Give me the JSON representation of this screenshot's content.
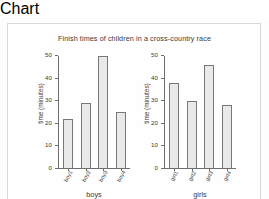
{
  "figure": {
    "title": "Finish times of children in a cross-country race",
    "background_color": "#fdfdfd",
    "border_color": "#d8d8d8",
    "bar_fill_color": "#e9e9e9",
    "bar_edge_color": "#777777",
    "axis_color": "#6e6e6e",
    "text_color": "#3a3a3a"
  },
  "chart_data": [
    {
      "type": "bar",
      "title": "Finish times of children in a cross-country race",
      "panel": "boys",
      "categories": [
        "boy1",
        "boy2",
        "boy3",
        "boy4"
      ],
      "values": [
        22,
        29,
        50,
        25
      ],
      "xlabel": "boys",
      "ylabel": "time (minutes)",
      "ylim": [
        0,
        50
      ],
      "yticks": [
        0,
        10,
        20,
        30,
        40,
        50
      ],
      "ytick_labels": [
        "0",
        "10",
        "20",
        "30",
        "40",
        "50"
      ],
      "grid": false,
      "legend": false
    },
    {
      "type": "bar",
      "title": "Finish times of children in a cross-country race",
      "panel": "girls",
      "categories": [
        "girl1",
        "girl2",
        "girl3",
        "girl4"
      ],
      "values": [
        38,
        30,
        46,
        28
      ],
      "xlabel": "girls",
      "ylabel": "time (minutes)",
      "ylim": [
        0,
        50
      ],
      "yticks": [
        0,
        10,
        20,
        30,
        40,
        50
      ],
      "ytick_labels": [
        "0",
        "10",
        "20",
        "30",
        "40",
        "50"
      ],
      "grid": false,
      "legend": false
    }
  ]
}
